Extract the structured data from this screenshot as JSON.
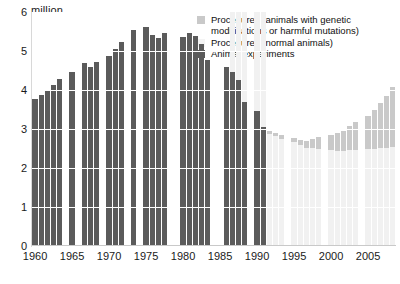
{
  "chart_data": {
    "type": "bar",
    "title": "",
    "subtitle": "",
    "xlabel": "",
    "ylabel": "",
    "unit_label": "million",
    "ylim": [
      0,
      6
    ],
    "y_ticks": [
      0,
      1,
      2,
      3,
      4,
      5,
      6
    ],
    "grid": true,
    "legend_position": "top-right",
    "stacked": true,
    "x_tick_labels": [
      "1960",
      "1965",
      "1970",
      "1975",
      "1980",
      "1985",
      "1990",
      "1995",
      "2000",
      "2005"
    ],
    "x": [
      1960,
      1961,
      1962,
      1963,
      1964,
      1965,
      1966,
      1967,
      1968,
      1969,
      1970,
      1971,
      1972,
      1973,
      1974,
      1975,
      1976,
      1977,
      1978,
      1979,
      1980,
      1981,
      1982,
      1983,
      1984,
      1985,
      1986,
      1987,
      1988,
      1989,
      1990,
      1991,
      1992,
      1993,
      1994,
      1995,
      1996,
      1997,
      1998,
      1999,
      2000,
      2001,
      2002,
      2003,
      2004,
      2005,
      2006,
      2007,
      2008,
      2009
    ],
    "series": [
      {
        "name": "Animal experiments",
        "color": "#5b5b5b",
        "values": [
          3.78,
          3.88,
          3.98,
          4.13,
          4.28,
          4.45,
          null,
          4.69,
          4.58,
          4.72,
          4.86,
          5.05,
          5.22,
          null,
          5.55,
          5.62,
          5.4,
          5.33,
          5.47,
          null,
          5.35,
          5.45,
          5.39,
          5.19,
          4.77,
          null,
          4.6,
          4.46,
          4.26,
          3.7,
          3.45,
          3.05,
          null,
          null,
          null,
          null,
          null,
          null,
          null,
          null,
          null,
          null,
          null,
          null,
          null,
          null,
          null,
          null,
          null,
          null
        ]
      },
      {
        "name": "Procedures (normal animals)",
        "color": "#f1f1f1",
        "values": [
          null,
          null,
          null,
          null,
          null,
          null,
          null,
          null,
          null,
          null,
          null,
          null,
          null,
          null,
          null,
          null,
          null,
          null,
          null,
          null,
          null,
          null,
          null,
          null,
          null,
          null,
          null,
          3.27,
          3.15,
          3.09,
          3.02,
          2.95,
          2.88,
          2.81,
          2.75,
          2.66,
          2.58,
          2.52,
          2.51,
          2.49,
          2.46,
          2.43,
          2.43,
          2.45,
          2.46,
          2.48,
          2.5,
          2.51,
          2.52,
          2.53
        ]
      },
      {
        "name": "Procedures (animals with genetic modifications or harmful mutations)",
        "color": "#c9c9c9",
        "values": [
          null,
          null,
          null,
          null,
          null,
          null,
          null,
          null,
          null,
          null,
          null,
          null,
          null,
          null,
          null,
          null,
          null,
          null,
          null,
          null,
          null,
          null,
          null,
          null,
          null,
          null,
          null,
          0.03,
          0.03,
          0.04,
          0.05,
          0.06,
          0.07,
          0.09,
          0.1,
          0.12,
          0.14,
          0.18,
          0.23,
          0.3,
          0.38,
          0.46,
          0.53,
          0.62,
          0.72,
          0.85,
          0.98,
          1.15,
          1.33,
          1.55
        ]
      }
    ]
  },
  "legend": {
    "items": [
      {
        "swatch": "gm",
        "line1": "Procedures (animals with genetic",
        "line2": "modifications or harmful mutations)"
      },
      {
        "swatch": "norm",
        "line1": "Procedures (normal animals)",
        "line2": ""
      },
      {
        "swatch": "exp",
        "line1": "Animal experiments",
        "line2": ""
      }
    ]
  },
  "colors": {
    "experiments": "#5b5b5b",
    "normal": "#f1f1f1",
    "genetic": "#c9c9c9",
    "gridline": "#ffffff",
    "axis": "#d8d8d8",
    "text": "#1a1a1a",
    "background": "#ffffff"
  }
}
